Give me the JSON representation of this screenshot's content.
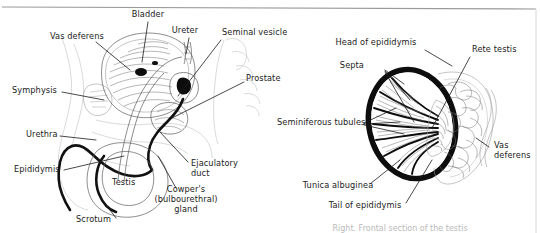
{
  "figure": {
    "name": "male-reproductive-anatomy-figure",
    "background_color": "#ffffff",
    "ink_color": "#1b1b1b",
    "caption_partial": "Right. Frontal section of the testis"
  },
  "left_diagram": {
    "name": "male-pelvis-sagittal-section",
    "labels": [
      {
        "id": "bladder",
        "text": "Bladder",
        "x": 148,
        "y": 17
      },
      {
        "id": "ureter",
        "text": "Ureter",
        "x": 185,
        "y": 33
      },
      {
        "id": "seminal_vesicle",
        "text": "Seminal vesicle",
        "x": 222,
        "y": 35
      },
      {
        "id": "prostate",
        "text": "Prostate",
        "x": 246,
        "y": 81
      },
      {
        "id": "vas_deferens",
        "text": "Vas deferens",
        "x": 50,
        "y": 39
      },
      {
        "id": "symphysis",
        "text": "Symphysis",
        "x": 12,
        "y": 93
      },
      {
        "id": "urethra",
        "text": "Urethra",
        "x": 26,
        "y": 137
      },
      {
        "id": "epididymis",
        "text": "Epididymis",
        "x": 14,
        "y": 172
      },
      {
        "id": "testis",
        "text": "Testis",
        "x": 112,
        "y": 185
      },
      {
        "id": "scrotum",
        "text": "Scrotum",
        "x": 76,
        "y": 222
      },
      {
        "id": "ejaculatory_duct",
        "text": "Ejaculatory",
        "x": 191,
        "y": 166
      },
      {
        "id": "ejaculatory_duct2",
        "text": "duct",
        "x": 191,
        "y": 176
      },
      {
        "id": "cowpers_1",
        "text": "Cowper's",
        "x": 186,
        "y": 192
      },
      {
        "id": "cowpers_2",
        "text": "(bulbourethral)",
        "x": 186,
        "y": 202
      },
      {
        "id": "cowpers_3",
        "text": "gland",
        "x": 186,
        "y": 212
      }
    ]
  },
  "right_diagram": {
    "name": "testis-frontal-section",
    "labels": [
      {
        "id": "head_of_epididymis",
        "text": "Head of epididymis",
        "x": 376,
        "y": 45
      },
      {
        "id": "rete_testis",
        "text": "Rete testis",
        "x": 472,
        "y": 52
      },
      {
        "id": "septa",
        "text": "Septa",
        "x": 364,
        "y": 68
      },
      {
        "id": "seminiferous",
        "text": "Seminiferous tubules",
        "x": 277,
        "y": 125
      },
      {
        "id": "vas_deferens_r",
        "text": "Vas",
        "x": 494,
        "y": 148
      },
      {
        "id": "vas_deferens_r2",
        "text": "deferens",
        "x": 494,
        "y": 158
      },
      {
        "id": "tunica_albuginea",
        "text": "Tunica albuginea",
        "x": 338,
        "y": 188
      },
      {
        "id": "tail_of_epididymis",
        "text": "Tail of epididymis",
        "x": 365,
        "y": 208
      }
    ]
  }
}
